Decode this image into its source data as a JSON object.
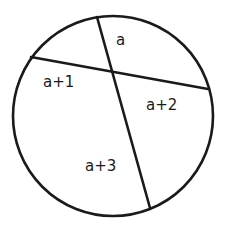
{
  "diagram": {
    "type": "intersecting-chords",
    "stroke_color": "#1a1a1a",
    "circle": {
      "cx": 113,
      "cy": 116,
      "r": 100
    },
    "chords": [
      {
        "name": "chord-1",
        "x1": 31,
        "y1": 57,
        "x2": 208,
        "y2": 89
      },
      {
        "name": "chord-2",
        "x1": 97,
        "y1": 17,
        "x2": 150,
        "y2": 208
      }
    ],
    "labels": [
      {
        "name": "segment-a",
        "text": "a",
        "x": 116,
        "y": 45
      },
      {
        "name": "segment-a-plus-1",
        "text": "a+1",
        "x": 43,
        "y": 87
      },
      {
        "name": "segment-a-plus-2",
        "text": "a+2",
        "x": 146,
        "y": 110
      },
      {
        "name": "segment-a-plus-3",
        "text": "a+3",
        "x": 85,
        "y": 171
      }
    ]
  }
}
